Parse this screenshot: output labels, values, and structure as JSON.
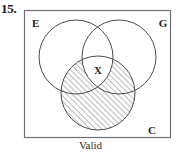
{
  "exercise": {
    "number": "15.",
    "caption": "Valid"
  },
  "diagram": {
    "type": "venn-three-circle",
    "box": {
      "x": 24,
      "y": 10,
      "width": 147,
      "height": 128
    },
    "circles": [
      {
        "id": "E",
        "label": "E",
        "cx": 76,
        "cy": 57,
        "r": 37,
        "label_x": 32,
        "label_y": 24
      },
      {
        "id": "G",
        "label": "G",
        "cx": 119,
        "cy": 57,
        "r": 37,
        "label_x": 163,
        "label_y": 24
      },
      {
        "id": "C",
        "label": "C",
        "cx": 98,
        "cy": 93,
        "r": 37,
        "label_x": 152,
        "label_y": 131
      }
    ],
    "marks": [
      {
        "id": "x-mark",
        "label": "X",
        "x": 98,
        "y": 71
      }
    ],
    "shading": {
      "region": "C minus (E intersect G)",
      "style": "diagonal-hatch",
      "angle_deg": 45,
      "spacing_px": 4,
      "color": "#55555a"
    },
    "colors": {
      "stroke": "#4a4a50",
      "box_stroke": "#6e6e74",
      "text": "#1f1f1f",
      "background": "#ffffff"
    }
  }
}
